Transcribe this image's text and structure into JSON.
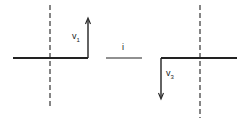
{
  "diagram": {
    "left_panel": {
      "vector_label": "v",
      "vector_subscript": "1",
      "vector_direction": "up"
    },
    "middle": {
      "label": "i"
    },
    "right_panel": {
      "vector_label": "v",
      "vector_subscript": "3",
      "vector_direction": "down"
    },
    "colors": {
      "line": "#222222",
      "dashed": "#444444",
      "background": "#ffffff"
    }
  }
}
